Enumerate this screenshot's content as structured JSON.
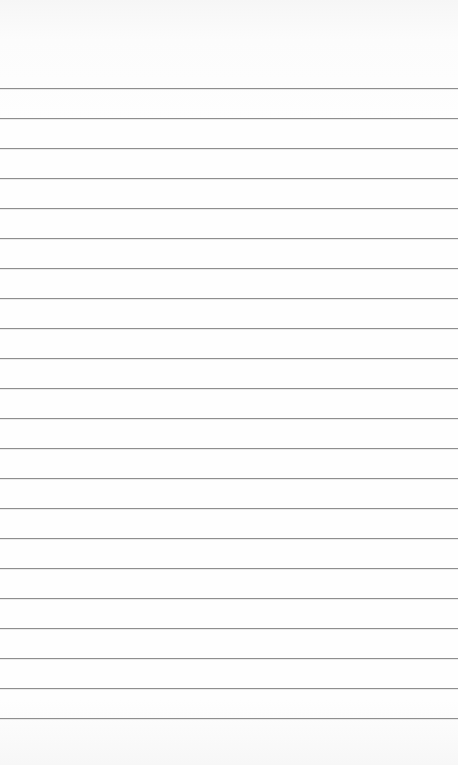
{
  "page": {
    "type": "lined-paper",
    "rule_count": 22,
    "rule_color": "#8e8e8e",
    "paper_color": "#fdfdfd",
    "text": ""
  }
}
